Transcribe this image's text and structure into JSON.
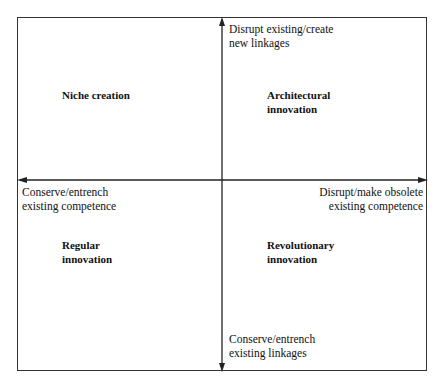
{
  "diagram": {
    "axes": {
      "top": {
        "line1": "Disrupt existing/create",
        "line2": "new linkages"
      },
      "bottom": {
        "line1": "Conserve/entrench",
        "line2": "existing linkages"
      },
      "left": {
        "line1": "Conserve/entrench",
        "line2": "existing competence"
      },
      "right": {
        "line1": "Disrupt/make obsolete",
        "line2": "existing competence"
      }
    },
    "quadrants": {
      "top_left": {
        "line1": "Niche creation",
        "line2": ""
      },
      "top_right": {
        "line1": "Architectural",
        "line2": "innovation"
      },
      "bottom_left": {
        "line1": "Regular",
        "line2": "innovation"
      },
      "bottom_right": {
        "line1": "Revolutionary",
        "line2": "innovation"
      }
    },
    "colors": {
      "line": "#222222",
      "background": "#ffffff"
    }
  }
}
